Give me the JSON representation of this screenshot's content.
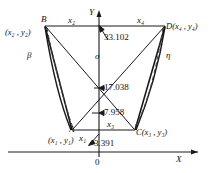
{
  "figure": {
    "axes": {
      "x_label": "X",
      "y_label": "Y",
      "origin_label": "0"
    },
    "vertices": [
      {
        "id": "A",
        "name": "A",
        "coord_label": "(x₁ , y₁)",
        "letter": "A",
        "px": 72,
        "py": 130
      },
      {
        "id": "B",
        "name": "B",
        "coord_label": "(x₂ , y₂)",
        "letter": "B",
        "px": 45,
        "py": 26
      },
      {
        "id": "C",
        "name": "C",
        "coord_label": "C(x₃ , y₃)",
        "letter": "C",
        "px": 135,
        "py": 130
      },
      {
        "id": "D",
        "name": "D",
        "coord_label": "D(x₄ , y₄)",
        "letter": "D",
        "px": 165,
        "py": 26
      }
    ],
    "edge_labels": [
      {
        "id": "x1",
        "text": "x₁"
      },
      {
        "id": "x2",
        "text": "x₂"
      },
      {
        "id": "x3",
        "text": "x₃"
      },
      {
        "id": "x4",
        "text": "x₄"
      }
    ],
    "greek_labels": [
      {
        "id": "beta",
        "text": "β"
      },
      {
        "id": "sigma",
        "text": "σ"
      },
      {
        "id": "eta",
        "text": "η"
      }
    ],
    "dimensions": [
      {
        "id": "d1",
        "value": "33.102"
      },
      {
        "id": "d2",
        "value": "17.038"
      },
      {
        "id": "d3",
        "value": "7.958"
      },
      {
        "id": "d4",
        "value": "3.391"
      }
    ],
    "colors": {
      "stroke": "#1a1a1a",
      "background": "#ffffff",
      "dashed": "#555555"
    }
  }
}
